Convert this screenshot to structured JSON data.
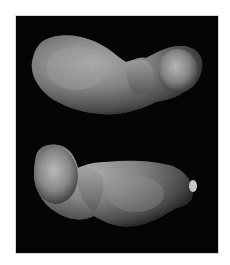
{
  "image": {
    "subject": "asteroid",
    "views": [
      {
        "position": "top",
        "description": "elongated peanut-shaped asteroid, larger lobe left, smaller lobe right"
      },
      {
        "position": "bottom",
        "description": "elongated peanut-shaped asteroid, rounded lobe left, larger body right"
      }
    ],
    "background_color": "#050505",
    "border_color": "#d8d8d8",
    "page_color": "#ffffff"
  }
}
